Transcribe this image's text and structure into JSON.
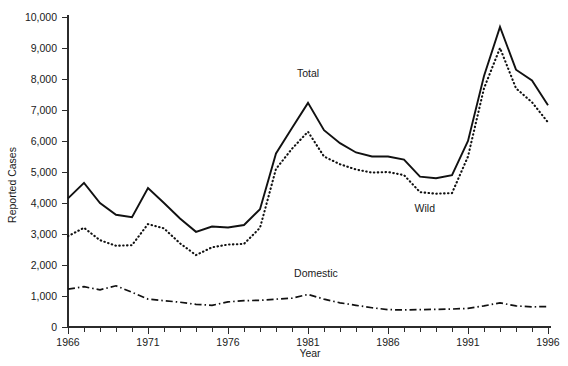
{
  "chart_data": {
    "type": "line",
    "title": "",
    "xlabel": "Year",
    "ylabel": "Reported Cases",
    "xlim": [
      1966,
      1996
    ],
    "ylim": [
      0,
      10000
    ],
    "grid": false,
    "legend_position": "inline-annotations",
    "x_tick_labels": [
      "1966",
      "1971",
      "1976",
      "1981",
      "1986",
      "1991",
      "1996"
    ],
    "x_tick_values": [
      1966,
      1971,
      1976,
      1981,
      1986,
      1991,
      1996
    ],
    "x_minor_tick_step": 1,
    "y_tick_labels": [
      "0",
      "1,000",
      "2,000",
      "3,000",
      "4,000",
      "5,000",
      "6,000",
      "7,000",
      "8,000",
      "9,000",
      "10,000"
    ],
    "y_tick_values": [
      0,
      1000,
      2000,
      3000,
      4000,
      5000,
      6000,
      7000,
      8000,
      9000,
      10000
    ],
    "x": [
      1966,
      1967,
      1968,
      1969,
      1970,
      1971,
      1972,
      1973,
      1974,
      1975,
      1976,
      1977,
      1978,
      1979,
      1980,
      1981,
      1982,
      1983,
      1984,
      1985,
      1986,
      1987,
      1988,
      1989,
      1990,
      1991,
      1992,
      1993,
      1994,
      1995,
      1996
    ],
    "series": [
      {
        "name": "Total",
        "label": "Total",
        "style": "solid",
        "values": [
          4150,
          4650,
          4000,
          3620,
          3540,
          4480,
          4000,
          3500,
          3070,
          3240,
          3210,
          3290,
          3800,
          5600,
          6420,
          7230,
          6350,
          5930,
          5630,
          5500,
          5500,
          5400,
          4850,
          4800,
          4900,
          6000,
          8100,
          9680,
          8300,
          7950,
          7150
        ]
      },
      {
        "name": "Wild",
        "label": "Wild",
        "style": "dotted",
        "values": [
          2930,
          3200,
          2800,
          2620,
          2640,
          3320,
          3180,
          2700,
          2320,
          2570,
          2660,
          2680,
          3200,
          5100,
          5750,
          6300,
          5500,
          5250,
          5080,
          4980,
          5000,
          4900,
          4350,
          4300,
          4320,
          5500,
          7700,
          9000,
          7700,
          7250,
          6600
        ]
      },
      {
        "name": "Domestic",
        "label": "Domestic",
        "style": "dash-dot",
        "values": [
          1220,
          1300,
          1200,
          1330,
          1120,
          900,
          850,
          800,
          730,
          700,
          810,
          850,
          860,
          900,
          930,
          1050,
          900,
          780,
          700,
          620,
          560,
          550,
          560,
          570,
          580,
          600,
          680,
          780,
          680,
          650,
          660
        ]
      }
    ],
    "annotations": [
      {
        "name": "total-label",
        "text": "Total",
        "x": 1981,
        "y": 8050
      },
      {
        "name": "wild-label",
        "text": "Wild",
        "x": 1988.3,
        "y": 3720
      },
      {
        "name": "domestic-label",
        "text": "Domestic",
        "x": 1981.5,
        "y": 1620
      }
    ],
    "colors": {
      "line": "#111111",
      "axis": "#2b2b2b",
      "text": "#1a1a1a",
      "background": "#ffffff"
    }
  }
}
